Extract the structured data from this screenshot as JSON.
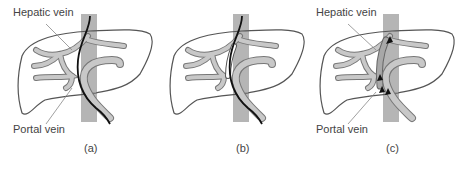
{
  "figure": {
    "panels": [
      {
        "id": "a",
        "caption": "(a)",
        "labels": {
          "hepatic": "Hepatic vein",
          "portal": "Portal vein"
        },
        "state": "guidewire passed from hepatic vein into portal vein"
      },
      {
        "id": "b",
        "caption": "(b)",
        "labels": {},
        "state": "tract dilated with balloon/stent along guidewire"
      },
      {
        "id": "c",
        "caption": "(c)",
        "labels": {
          "hepatic": "Hepatic vein",
          "portal": "Portal vein"
        },
        "state": "shunt in place with flow arrows from portal to hepatic vein"
      }
    ],
    "colors": {
      "outline": "#555555",
      "vessel_fill": "#bdbdbd",
      "ivc_fill": "#b5b5b5",
      "guidewire": "#111111",
      "stent": "#ffffff",
      "text": "#444444"
    }
  }
}
